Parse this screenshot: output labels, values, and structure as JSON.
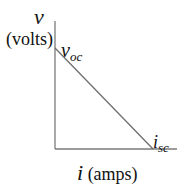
{
  "diagram": {
    "y_axis": {
      "symbol": "v",
      "unit": "(volts)"
    },
    "x_axis": {
      "symbol": "i",
      "unit": "(amps)"
    },
    "intercepts": {
      "voltage": {
        "base": "v",
        "sub": "oc"
      },
      "current": {
        "base": "i",
        "sub": "sc"
      }
    },
    "colors": {
      "axes": "#7a7a7a",
      "line": "#6e6e6e",
      "text": "#111111"
    }
  }
}
